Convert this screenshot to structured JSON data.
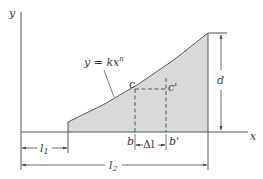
{
  "diagram": {
    "type": "area under curve y = kx^n",
    "axes": {
      "x_label": "x",
      "y_label": "y"
    },
    "curve": {
      "equation_lhs": "y = kx",
      "equation_exponent": "n"
    },
    "points": {
      "c": "c",
      "c_prime": "c'",
      "b": "b",
      "b_prime": "b'"
    },
    "dimensions": {
      "l1_main": "l",
      "l1_sub": "1",
      "l2_main": "l",
      "l2_sub": "2",
      "delta_l": "Δl",
      "d": "d"
    },
    "colors": {
      "fill": "#d9d9d9",
      "line": "#555555",
      "text": "#3a3a3a"
    }
  }
}
